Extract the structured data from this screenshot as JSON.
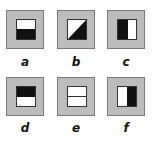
{
  "figure": {
    "tiles": [
      {
        "id": "a",
        "label": "a",
        "pattern": "bottom-black",
        "x": 6,
        "y": 10
      },
      {
        "id": "b",
        "label": "b",
        "pattern": "diagonal-lower-right-black",
        "x": 57,
        "y": 10
      },
      {
        "id": "c",
        "label": "c",
        "pattern": "left-black",
        "x": 107,
        "y": 10
      },
      {
        "id": "d",
        "label": "d",
        "pattern": "top-black",
        "x": 6,
        "y": 77
      },
      {
        "id": "e",
        "label": "e",
        "pattern": "horizontal-line-white",
        "x": 57,
        "y": 77
      },
      {
        "id": "f",
        "label": "f",
        "pattern": "right-black",
        "x": 107,
        "y": 77
      }
    ],
    "colors": {
      "frame": "#bcbcbc",
      "frame_border": "#7a7a7a",
      "black": "#111111",
      "white": "#ffffff"
    }
  }
}
